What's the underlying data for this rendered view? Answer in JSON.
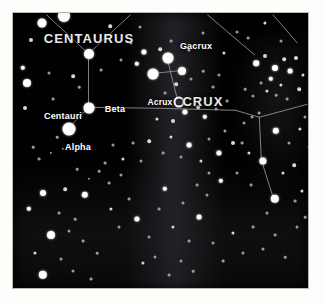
{
  "chart_data": {
    "type": "scatter",
    "xlabel": "",
    "ylabel": "",
    "xlim": [
      0,
      297
    ],
    "ylim": [
      0,
      277
    ],
    "grid": false,
    "legend": "none",
    "background_color": "#010101",
    "star_color": "#ffffff",
    "line_color": "#8f8f96",
    "frame_color": "#b9b9b4",
    "page_color": "#fdfdfb",
    "constellation_labels": [
      {
        "text": "CENTAURUS",
        "x": 76,
        "y": 25,
        "kind": "constellation"
      },
      {
        "text": "CRUX",
        "x": 190,
        "y": 88,
        "kind": "constellation"
      }
    ],
    "star_labels": [
      {
        "text": "Gacrux",
        "x": 183,
        "y": 33,
        "kind": "star-name"
      },
      {
        "text": "Acrux",
        "x": 147,
        "y": 89,
        "kind": "star-name-small"
      },
      {
        "text": "Beta",
        "x": 102,
        "y": 96,
        "kind": "star-name"
      },
      {
        "text": "Centauri",
        "x": 50,
        "y": 103,
        "kind": "star-name"
      },
      {
        "text": "Alpha",
        "x": 65,
        "y": 134,
        "kind": "star-name"
      }
    ],
    "named_stars": [
      {
        "name": "Gacrux",
        "x": 155,
        "y": 45,
        "r": 5.5
      },
      {
        "name": "Acrux",
        "x": 166,
        "y": 89,
        "r": 4.5,
        "ring": true
      },
      {
        "name": "Mimosa",
        "x": 169,
        "y": 58,
        "r": 4.0
      },
      {
        "name": "Delta Crucis",
        "x": 140,
        "y": 61,
        "r": 5.5
      },
      {
        "name": "Beta Centauri",
        "x": 76,
        "y": 95,
        "r": 5.5
      },
      {
        "name": "Alpha Centauri",
        "x": 56,
        "y": 116,
        "r": 6.5
      },
      {
        "name": "Epsilon Centauri",
        "x": 76,
        "y": 41,
        "r": 5.0
      }
    ],
    "constellation_lines": [
      {
        "name": "crux-upright",
        "points": [
          [
            155,
            45
          ],
          [
            166,
            89
          ]
        ]
      },
      {
        "name": "crux-crossbar",
        "points": [
          [
            140,
            61
          ],
          [
            169,
            58
          ]
        ]
      },
      {
        "name": "centaurus-spine",
        "points": [
          [
            76,
            41
          ],
          [
            76,
            95
          ]
        ]
      },
      {
        "name": "centaurus-alpha-beta",
        "points": [
          [
            76,
            95
          ],
          [
            56,
            116
          ]
        ]
      },
      {
        "name": "centaurus-upper-left",
        "points": [
          [
            76,
            41
          ],
          [
            34,
            2
          ]
        ]
      },
      {
        "name": "centaurus-upper-right",
        "points": [
          [
            76,
            41
          ],
          [
            118,
            2
          ]
        ]
      },
      {
        "name": "centaurus-east-arm",
        "points": [
          [
            76,
            95
          ],
          [
            146,
            96
          ]
        ]
      },
      {
        "name": "centaurus-east-extend",
        "points": [
          [
            146,
            96
          ],
          [
            224,
            98
          ]
        ]
      },
      {
        "name": "upper-right-diagonal-a",
        "points": [
          [
            196,
            2
          ],
          [
            243,
            42
          ]
        ]
      },
      {
        "name": "upper-right-diagonal-b",
        "points": [
          [
            262,
            2
          ],
          [
            286,
            30
          ]
        ]
      },
      {
        "name": "right-cluster-line",
        "points": [
          [
            224,
            98
          ],
          [
            248,
            105
          ]
        ]
      },
      {
        "name": "right-down-line",
        "points": [
          [
            248,
            105
          ],
          [
            250,
            148
          ]
        ]
      },
      {
        "name": "right-edge-line",
        "points": [
          [
            248,
            105
          ],
          [
            296,
            92
          ]
        ]
      },
      {
        "name": "right-lower-line",
        "points": [
          [
            250,
            148
          ],
          [
            262,
            186
          ]
        ]
      }
    ],
    "stars": [
      [
        29,
        10,
        4.5
      ],
      [
        18,
        27,
        2.0
      ],
      [
        51,
        3,
        6.0
      ],
      [
        64,
        22,
        1.6
      ],
      [
        10,
        55,
        2.2
      ],
      [
        14,
        70,
        4.0
      ],
      [
        12,
        95,
        2.0
      ],
      [
        36,
        60,
        1.5
      ],
      [
        40,
        86,
        1.4
      ],
      [
        60,
        63,
        1.8
      ],
      [
        66,
        74,
        1.3
      ],
      [
        97,
        13,
        1.8
      ],
      [
        108,
        47,
        1.5
      ],
      [
        88,
        57,
        1.4
      ],
      [
        118,
        30,
        1.6
      ],
      [
        127,
        14,
        1.5
      ],
      [
        131,
        39,
        2.6
      ],
      [
        124,
        51,
        2.2
      ],
      [
        147,
        36,
        1.8
      ],
      [
        158,
        28,
        1.4
      ],
      [
        176,
        37,
        1.6
      ],
      [
        190,
        20,
        1.5
      ],
      [
        163,
        71,
        1.8
      ],
      [
        178,
        66,
        1.5
      ],
      [
        152,
        80,
        1.4
      ],
      [
        172,
        99,
        2.6
      ],
      [
        185,
        94,
        1.8
      ],
      [
        192,
        104,
        2.2
      ],
      [
        160,
        108,
        2.0
      ],
      [
        144,
        106,
        1.6
      ],
      [
        203,
        96,
        1.4
      ],
      [
        211,
        40,
        1.6
      ],
      [
        224,
        19,
        1.5
      ],
      [
        206,
        62,
        1.5
      ],
      [
        235,
        25,
        1.4
      ],
      [
        252,
        10,
        1.6
      ],
      [
        268,
        28,
        1.5
      ],
      [
        243,
        50,
        2.8
      ],
      [
        252,
        43,
        2.0
      ],
      [
        262,
        55,
        3.0
      ],
      [
        271,
        46,
        1.8
      ],
      [
        258,
        66,
        2.2
      ],
      [
        268,
        72,
        1.6
      ],
      [
        277,
        58,
        2.4
      ],
      [
        283,
        45,
        2.0
      ],
      [
        290,
        62,
        1.6
      ],
      [
        248,
        70,
        1.4
      ],
      [
        254,
        78,
        1.6
      ],
      [
        263,
        82,
        1.3
      ],
      [
        240,
        83,
        1.5
      ],
      [
        274,
        86,
        1.4
      ],
      [
        286,
        76,
        1.8
      ],
      [
        231,
        110,
        1.5
      ],
      [
        239,
        104,
        1.5
      ],
      [
        246,
        100,
        1.4
      ],
      [
        263,
        118,
        3.2
      ],
      [
        287,
        116,
        1.6
      ],
      [
        276,
        130,
        1.5
      ],
      [
        250,
        148,
        3.6
      ],
      [
        236,
        140,
        1.6
      ],
      [
        229,
        130,
        1.4
      ],
      [
        281,
        152,
        1.8
      ],
      [
        262,
        186,
        4.2
      ],
      [
        289,
        178,
        1.6
      ],
      [
        220,
        130,
        2.0
      ],
      [
        212,
        118,
        1.5
      ],
      [
        206,
        140,
        2.6
      ],
      [
        196,
        126,
        1.5
      ],
      [
        188,
        148,
        1.6
      ],
      [
        176,
        132,
        2.4
      ],
      [
        168,
        144,
        1.5
      ],
      [
        158,
        124,
        1.6
      ],
      [
        150,
        140,
        1.4
      ],
      [
        136,
        128,
        1.8
      ],
      [
        128,
        148,
        1.5
      ],
      [
        120,
        130,
        1.4
      ],
      [
        110,
        146,
        1.6
      ],
      [
        100,
        132,
        1.5
      ],
      [
        92,
        150,
        1.4
      ],
      [
        44,
        124,
        1.3
      ],
      [
        50,
        136,
        1.2
      ],
      [
        38,
        140,
        1.2
      ],
      [
        26,
        146,
        1.4
      ],
      [
        20,
        134,
        1.3
      ],
      [
        30,
        180,
        3.0
      ],
      [
        52,
        176,
        1.8
      ],
      [
        72,
        182,
        3.2
      ],
      [
        16,
        196,
        2.2
      ],
      [
        46,
        200,
        1.4
      ],
      [
        62,
        206,
        1.3
      ],
      [
        38,
        222,
        4.0
      ],
      [
        56,
        218,
        1.5
      ],
      [
        70,
        228,
        1.4
      ],
      [
        22,
        240,
        1.6
      ],
      [
        48,
        246,
        1.5
      ],
      [
        84,
        240,
        1.3
      ],
      [
        30,
        262,
        4.2
      ],
      [
        60,
        258,
        1.5
      ],
      [
        78,
        266,
        1.4
      ],
      [
        98,
        196,
        1.6
      ],
      [
        106,
        214,
        1.5
      ],
      [
        116,
        186,
        1.4
      ],
      [
        124,
        206,
        2.6
      ],
      [
        136,
        224,
        1.5
      ],
      [
        146,
        196,
        1.4
      ],
      [
        152,
        176,
        2.2
      ],
      [
        160,
        214,
        1.6
      ],
      [
        170,
        190,
        1.5
      ],
      [
        176,
        228,
        1.4
      ],
      [
        186,
        204,
        2.4
      ],
      [
        194,
        182,
        1.5
      ],
      [
        130,
        250,
        1.6
      ],
      [
        142,
        244,
        1.5
      ],
      [
        156,
        262,
        1.4
      ],
      [
        168,
        248,
        1.5
      ],
      [
        180,
        258,
        1.3
      ],
      [
        200,
        230,
        1.5
      ],
      [
        210,
        248,
        1.4
      ],
      [
        220,
        220,
        1.6
      ],
      [
        230,
        240,
        1.5
      ],
      [
        240,
        214,
        1.4
      ],
      [
        250,
        236,
        1.5
      ],
      [
        262,
        222,
        1.4
      ],
      [
        272,
        244,
        1.3
      ],
      [
        284,
        214,
        1.5
      ],
      [
        208,
        168,
        2.2
      ],
      [
        224,
        160,
        1.5
      ],
      [
        238,
        172,
        1.4
      ],
      [
        196,
        160,
        1.5
      ],
      [
        184,
        172,
        1.4
      ],
      [
        254,
        200,
        1.5
      ],
      [
        270,
        160,
        1.6
      ],
      [
        282,
        188,
        1.4
      ],
      [
        292,
        204,
        1.3
      ],
      [
        96,
        170,
        1.4
      ],
      [
        86,
        158,
        1.3
      ],
      [
        108,
        162,
        1.5
      ],
      [
        64,
        156,
        1.3
      ],
      [
        76,
        166,
        1.2
      ],
      [
        292,
        104,
        1.5
      ],
      [
        296,
        134,
        1.4
      ],
      [
        214,
        88,
        1.4
      ],
      [
        232,
        76,
        1.3
      ],
      [
        200,
        74,
        1.4
      ],
      [
        190,
        58,
        1.3
      ]
    ]
  }
}
